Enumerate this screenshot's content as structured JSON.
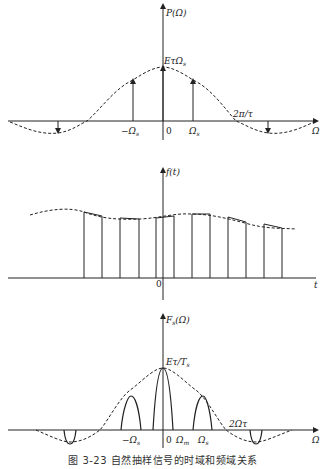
{
  "figure": {
    "caption": "图 3-23   自然抽样信号的时域和频域关系",
    "panels": [
      {
        "id": "spectrum-sampled-pulse",
        "y_label": "P(Ω)",
        "x_label": "Ω",
        "peak_label": "EτΩs",
        "ticks": [
          "-Ωs",
          "0",
          "Ωs"
        ],
        "zero_label": "2π/τ"
      },
      {
        "id": "time-domain",
        "y_label": "f(t)",
        "x_label": "t",
        "origin_label": "0"
      },
      {
        "id": "spectrum-natural-sampled",
        "y_label": "Fs(Ω)",
        "x_label": "Ω",
        "peak_label": "Eτ/Ts",
        "ticks": [
          "-Ωs",
          "0",
          "Ωm",
          "Ωs"
        ],
        "zero_label": "2Ωτ"
      }
    ]
  },
  "labels": {
    "p1_y": "P(Ω)",
    "p1_x": "Ω",
    "p1_peak": "EτΩ",
    "p1_peak_sub": "s",
    "p1_neg": "−Ω",
    "p1_neg_sub": "s",
    "p1_zero": "0",
    "p1_pos": "Ω",
    "p1_pos_sub": "s",
    "p1_zero_cross": "2π/τ",
    "p2_y": "f(t)",
    "p2_x": "t",
    "p2_origin": "0",
    "p3_y": "F",
    "p3_y_sub": "s",
    "p3_y_arg": "(Ω)",
    "p3_x": "Ω",
    "p3_peak": "Eτ/T",
    "p3_peak_sub": "s",
    "p3_neg": "−Ω",
    "p3_neg_sub": "s",
    "p3_zero": "0",
    "p3_m": "Ω",
    "p3_m_sub": "m",
    "p3_pos": "Ω",
    "p3_pos_sub": "s",
    "p3_zero_cross": "2Ωτ"
  }
}
